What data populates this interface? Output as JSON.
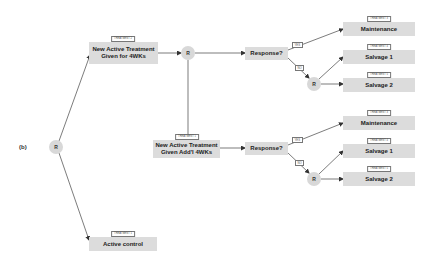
{
  "panel_label": "(b)",
  "randomize_symbol": "R",
  "top_arm": {
    "treatment_tag": "TREATMENT 2",
    "label": "New Active Treatment Given for 4WKs",
    "line1": "New Active Treatment",
    "line2": "Given for 4WKs",
    "response": "Response?",
    "yes": "YES",
    "no": "NO",
    "outcomes": [
      {
        "tag": "TREATMENT 3",
        "label": "Maintenance"
      },
      {
        "tag": "TREATMENT 4",
        "label": "Salvage 1"
      },
      {
        "tag": "TREATMENT 5",
        "label": "Salvage 2"
      }
    ]
  },
  "middle_arm": {
    "treatment_tag": "TREATMENT 1",
    "line1": "New Active Treatment",
    "line2": "Given Add'l 4WKs",
    "response": "Response?",
    "yes": "YES",
    "no": "NO",
    "outcomes": [
      {
        "tag": "TREATMENT 3",
        "label": "Maintenance"
      },
      {
        "tag": "TREATMENT 4",
        "label": "Salvage 1"
      },
      {
        "tag": "TREATMENT 5",
        "label": "Salvage 2"
      }
    ]
  },
  "control_arm": {
    "treatment_tag": "TREATMENT 1",
    "label": "Active control"
  }
}
